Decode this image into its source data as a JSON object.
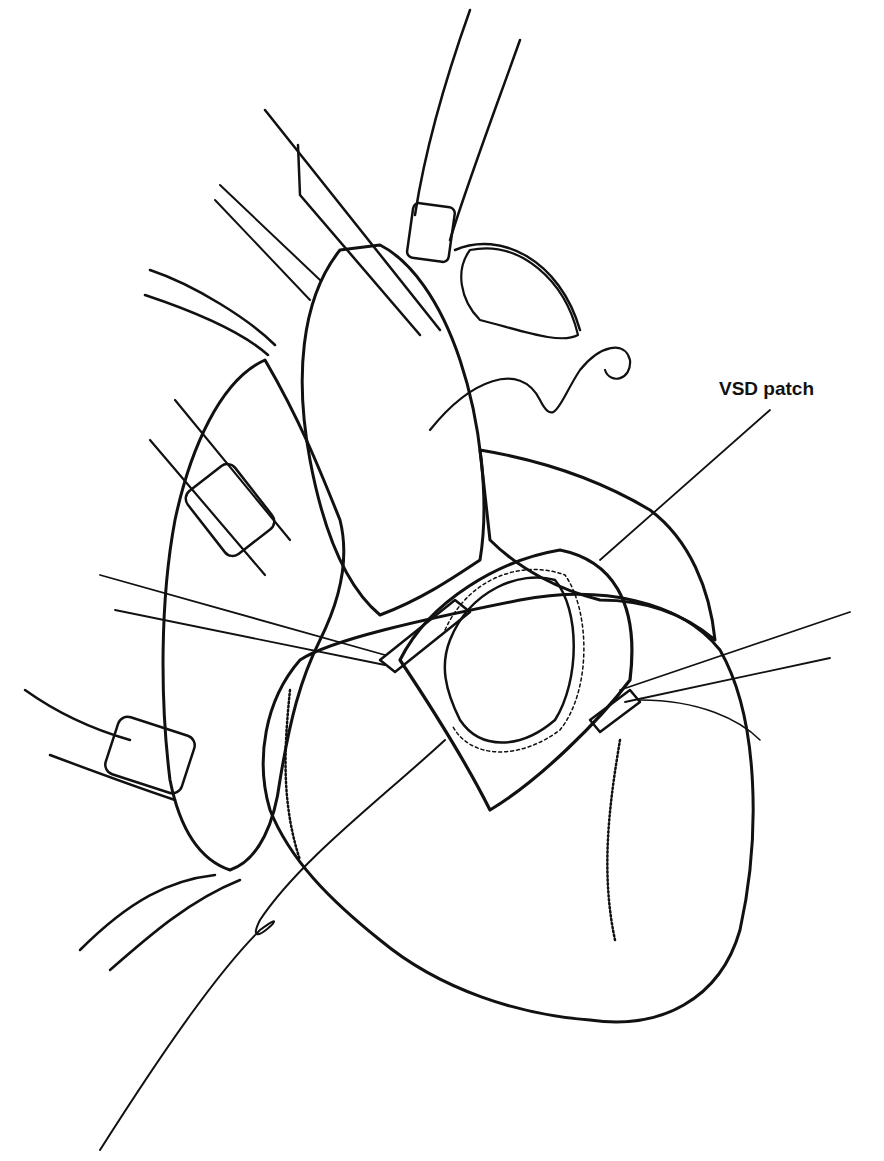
{
  "figure": {
    "labels": [
      {
        "text": "VSD patch",
        "x": 719,
        "y": 378,
        "leader": {
          "from": [
            770,
            410
          ],
          "to": [
            600,
            560
          ]
        }
      }
    ],
    "colors": {
      "ink": "#111111",
      "background": "#ffffff"
    }
  }
}
